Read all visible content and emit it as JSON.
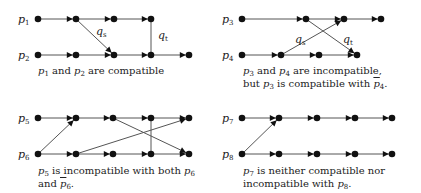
{
  "panels": [
    {
      "id": "panel-1",
      "rows": [
        {
          "label": "p",
          "sub": "1",
          "y": 19,
          "nodes": [
            38,
            76,
            114,
            151
          ]
        },
        {
          "label": "p",
          "sub": "2",
          "y": 55,
          "nodes": [
            38,
            76,
            114,
            151,
            189
          ]
        }
      ],
      "cross_edges": [
        {
          "from": [
            76,
            19
          ],
          "to": [
            114,
            55
          ],
          "label": "q",
          "sub": "s",
          "arrow": true,
          "label_pos": [
            96,
            35
          ]
        },
        {
          "from": [
            151,
            19
          ],
          "to": [
            151,
            55
          ],
          "label": "q",
          "sub": "t",
          "arrow": false,
          "label_pos": [
            158,
            39
          ]
        }
      ],
      "caption": {
        "x": 38,
        "y": 64,
        "lines": [
          [
            {
              "t": "p",
              "s": "1",
              "m": true
            },
            {
              "t": " and "
            },
            {
              "t": "p",
              "s": "2",
              "m": true
            },
            {
              "t": " are compatible"
            }
          ]
        ]
      }
    },
    {
      "id": "panel-2",
      "rows": [
        {
          "label": "p",
          "sub": "3",
          "y": 19,
          "nodes": [
            242,
            306,
            344,
            381
          ]
        },
        {
          "label": "p",
          "sub": "4",
          "y": 55,
          "nodes": [
            242,
            281,
            319,
            357
          ]
        }
      ],
      "cross_edges": [
        {
          "from": [
            281,
            55
          ],
          "to": [
            344,
            19
          ],
          "label": "q",
          "sub": "s",
          "arrow": true,
          "label_pos": [
            295,
            43
          ]
        },
        {
          "from": [
            306,
            19
          ],
          "to": [
            357,
            55
          ],
          "label": "q",
          "sub": "t",
          "arrow": true,
          "label_pos": [
            343,
            43
          ]
        }
      ],
      "caption": {
        "x": 243,
        "y": 64,
        "lines": [
          [
            {
              "t": "p",
              "s": "3",
              "m": true
            },
            {
              "t": " and "
            },
            {
              "t": "p",
              "s": "4",
              "m": true
            },
            {
              "t": " are incompatible,"
            }
          ],
          [
            {
              "t": "but "
            },
            {
              "t": "p",
              "s": "3",
              "m": true
            },
            {
              "t": " is compatible with "
            },
            {
              "t": "p",
              "s": "4",
              "m": true,
              "bar": true
            },
            {
              "t": "."
            }
          ]
        ]
      }
    },
    {
      "id": "panel-3",
      "rows": [
        {
          "label": "p",
          "sub": "5",
          "y": 118,
          "nodes": [
            38,
            76,
            113,
            151,
            189
          ]
        },
        {
          "label": "p",
          "sub": "6",
          "y": 154,
          "nodes": [
            38,
            76,
            113,
            151,
            189
          ]
        }
      ],
      "cross_edges": [
        {
          "from": [
            38,
            154
          ],
          "to": [
            76,
            118
          ],
          "arrow": true
        },
        {
          "from": [
            113,
            118
          ],
          "to": [
            189,
            154
          ],
          "arrow": true
        },
        {
          "from": [
            76,
            154
          ],
          "to": [
            189,
            118
          ],
          "arrow": true
        },
        {
          "from": [
            151,
            118
          ],
          "to": [
            151,
            154
          ],
          "arrow": false
        }
      ],
      "caption": {
        "x": 38,
        "y": 164,
        "lines": [
          [
            {
              "t": "p",
              "s": "5",
              "m": true
            },
            {
              "t": " is incompatible with both "
            },
            {
              "t": "p",
              "s": "6",
              "m": true
            }
          ],
          [
            {
              "t": "and "
            },
            {
              "t": "p",
              "s": "6",
              "m": true,
              "bar": true
            },
            {
              "t": "."
            }
          ]
        ]
      }
    },
    {
      "id": "panel-4",
      "rows": [
        {
          "label": "p",
          "sub": "7",
          "y": 118,
          "nodes": [
            242,
            279,
            317,
            355,
            392
          ]
        },
        {
          "label": "p",
          "sub": "8",
          "y": 154,
          "nodes": [
            242,
            279,
            317,
            355,
            392
          ]
        }
      ],
      "cross_edges": [
        {
          "from": [
            242,
            154
          ],
          "to": [
            279,
            118
          ],
          "arrow": true
        }
      ],
      "caption": {
        "x": 243,
        "y": 164,
        "lines": [
          [
            {
              "t": "p",
              "s": "7",
              "m": true
            },
            {
              "t": " is neither compatible nor"
            }
          ],
          [
            {
              "t": "incompatible with "
            },
            {
              "t": "p",
              "s": "8",
              "m": true
            },
            {
              "t": "."
            }
          ]
        ]
      }
    }
  ],
  "style": {
    "edge_color": "#555555",
    "node_color": "#111111"
  }
}
